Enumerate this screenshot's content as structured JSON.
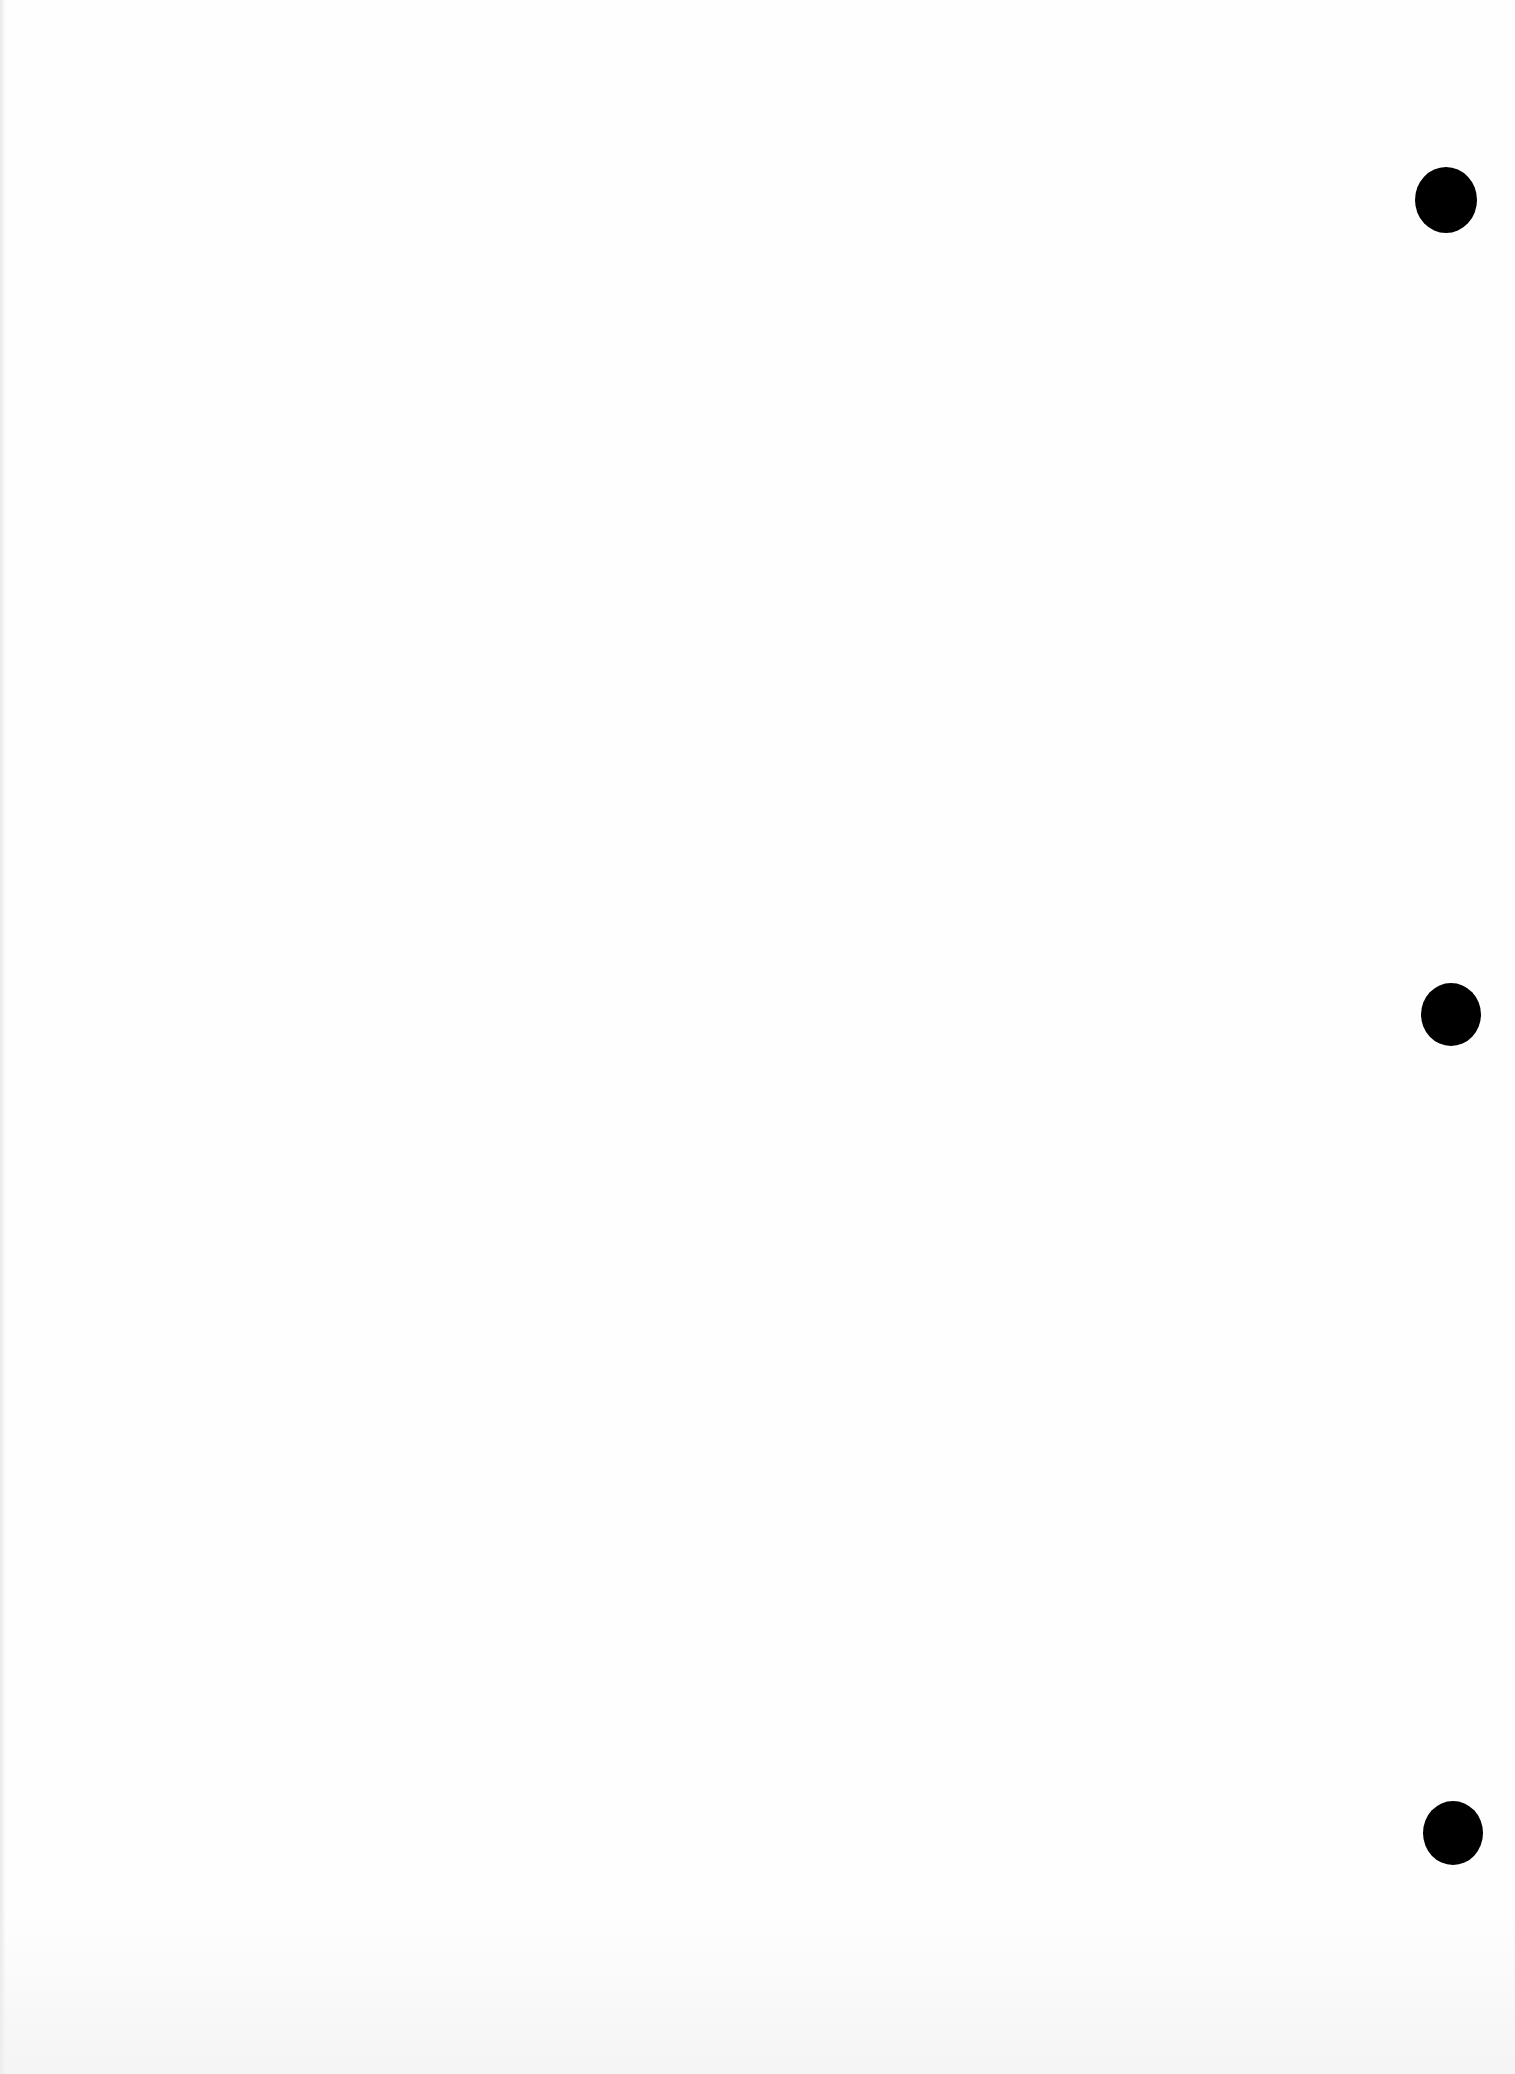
{
  "document": {
    "type": "blank scanned page",
    "text_content": "",
    "background_color": "#fefefe"
  },
  "punch_holes": [
    {
      "x": 1415,
      "y": 167,
      "w": 62,
      "h": 66,
      "color": "#000000"
    },
    {
      "x": 1421,
      "y": 983,
      "w": 60,
      "h": 63,
      "color": "#000000"
    },
    {
      "x": 1423,
      "y": 1801,
      "w": 60,
      "h": 64,
      "color": "#000000"
    }
  ]
}
